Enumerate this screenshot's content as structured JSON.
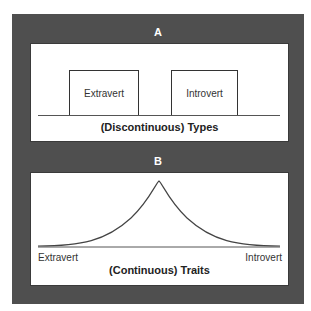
{
  "figure": {
    "frame_color": "#4f4f4f",
    "panel_a": {
      "letter": "A",
      "boxes": [
        {
          "label": "Extravert"
        },
        {
          "label": "Introvert"
        }
      ],
      "caption": "(Discontinuous) Types"
    },
    "panel_b": {
      "letter": "B",
      "left_label": "Extravert",
      "right_label": "Introvert",
      "caption": "(Continuous) Traits",
      "curve": "normal distribution (bell curve)"
    }
  }
}
